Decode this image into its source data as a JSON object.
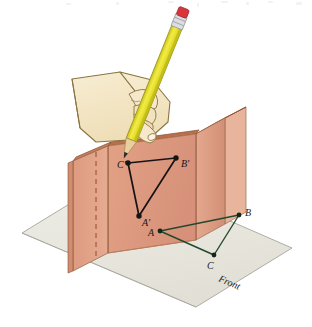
{
  "illustration": {
    "title": "Projection of a triangle onto a vertical plane",
    "description": "A hand holding a yellow pencil draws the projected triangle A', B', C' onto the salmon-colored vertical panel of a folded projection box, while the original triangle A, B, C lies in green on the horizontal base plane labeled Front."
  },
  "labels": {
    "projected": {
      "a_prime": "A'",
      "b_prime": "B'",
      "c_prime": "C'"
    },
    "base": {
      "a": "A",
      "b": "B",
      "c": "C"
    },
    "plane_name": "Front"
  },
  "colors": {
    "panel_face": "#df9d82",
    "panel_face_shadow": "#d08e72",
    "panel_edge_top": "#b8714f",
    "panel_edge_dark": "#8d4b2c",
    "panel_side": "#e3ad93",
    "base_plane": "#e9e7de",
    "base_plane_edge": "#9c9a92",
    "triangle_base_stroke": "#23482e",
    "triangle_projected_stroke": "#141414",
    "pencil_body": "#e8e130",
    "pencil_body_dark": "#c2bd1c",
    "pencil_eraser": "#d8343a",
    "pencil_ferrule": "#dcdde0",
    "pencil_tip_wood": "#e8cfa0",
    "pencil_lead": "#2c2c2c",
    "hand_skin": "#f4e5c4",
    "hand_outline": "#8a7441",
    "hidden_line": "#8d4b2c"
  },
  "geometry": {
    "projected_triangle": {
      "a_prime": [
        139,
        216
      ],
      "b_prime": [
        176,
        158
      ],
      "c_prime": [
        128,
        163
      ]
    },
    "base_triangle": {
      "a": [
        160,
        231
      ],
      "b": [
        239,
        215
      ],
      "c": [
        214,
        255
      ]
    }
  },
  "icons": {
    "pencil": "pencil-icon",
    "hand": "hand-icon"
  }
}
